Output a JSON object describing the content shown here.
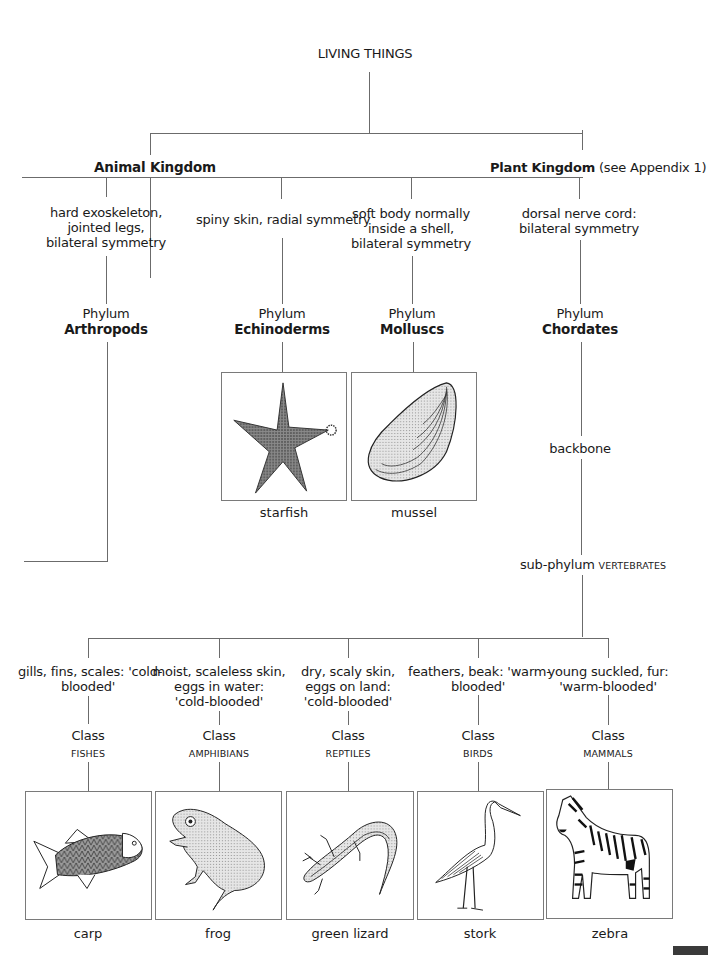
{
  "root": {
    "label": "LIVING THINGS"
  },
  "kingdoms": [
    {
      "name": "Animal Kingdom"
    },
    {
      "name": "Plant Kingdom",
      "note": "(see Appendix 1)"
    }
  ],
  "phyla": [
    {
      "trait_lines": [
        "hard exoskeleton,",
        "jointed legs,",
        "bilateral symmetry"
      ],
      "rank": "Phylum",
      "name": "Arthropods"
    },
    {
      "trait_lines": [
        "spiny skin, radial symmetry"
      ],
      "rank": "Phylum",
      "name": "Echinoderms",
      "example": "starfish"
    },
    {
      "trait_lines": [
        "soft body normally",
        "inside a shell,",
        "bilateral symmetry"
      ],
      "rank": "Phylum",
      "name": "Molluscs",
      "example": "mussel"
    },
    {
      "trait_lines": [
        "dorsal nerve cord:",
        "bilateral symmetry"
      ],
      "rank": "Phylum",
      "name": "Chordates"
    }
  ],
  "chordate_branch": {
    "feature": "backbone",
    "subphylum_prefix": "sub-phylum",
    "subphylum_name": "VERTEBRATES"
  },
  "classes": [
    {
      "trait_lines": [
        "gills, fins, scales: 'cold-",
        "blooded'"
      ],
      "rank": "Class",
      "name": "FISHES",
      "example": "carp"
    },
    {
      "trait_lines": [
        "moist, scaleless skin,",
        "eggs in water:",
        "'cold-blooded'"
      ],
      "rank": "Class",
      "name": "AMPHIBIANS",
      "example": "frog"
    },
    {
      "trait_lines": [
        "dry, scaly skin,",
        "eggs on land:",
        "'cold-blooded'"
      ],
      "rank": "Class",
      "name": "REPTILES",
      "example": "green lizard"
    },
    {
      "trait_lines": [
        "feathers, beak: 'warm-",
        "blooded'"
      ],
      "rank": "Class",
      "name": "BIRDS",
      "example": "stork"
    },
    {
      "trait_lines": [
        "young suckled, fur:",
        "'warm-blooded'"
      ],
      "rank": "Class",
      "name": "MAMMALS",
      "example": "zebra"
    }
  ],
  "illustrations": [
    {
      "icon": "starfish-illustration",
      "caption": "starfish"
    },
    {
      "icon": "mussel-illustration",
      "caption": "mussel"
    },
    {
      "icon": "carp-illustration",
      "caption": "carp"
    },
    {
      "icon": "frog-illustration",
      "caption": "frog"
    },
    {
      "icon": "lizard-illustration",
      "caption": "green lizard"
    },
    {
      "icon": "stork-illustration",
      "caption": "stork"
    },
    {
      "icon": "zebra-illustration",
      "caption": "zebra"
    }
  ],
  "colors": {
    "line": "#6b6b6b",
    "text": "#1a1a1a",
    "box_border": "#7a7a7a",
    "page_tab": "#3a3a3a"
  }
}
